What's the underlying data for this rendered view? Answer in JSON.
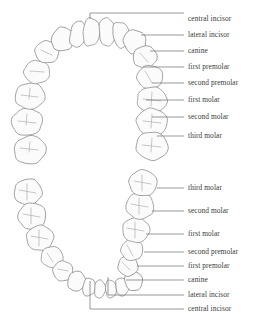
{
  "diagram": {
    "colors": {
      "tooth_outline": "#8a8a8a",
      "tooth_fill": "#fbfbfc",
      "groove": "#b0b0b0",
      "leader_line": "#6e6e6e",
      "label_text": "#3a3a3a",
      "background": "#ffffff"
    },
    "arches": [
      {
        "name": "upper-arch",
        "label": "maxillary",
        "labels": [
          {
            "id": "upper-central-incisor",
            "text": "central incisor",
            "x": 188,
            "y": 21,
            "leader": "M90,19 L90,13 L184,13"
          },
          {
            "id": "upper-lateral-incisor",
            "text": "lateral incisor",
            "x": 188,
            "y": 37,
            "leader": "M141,35 L184,35"
          },
          {
            "id": "upper-canine",
            "text": "canine",
            "x": 188,
            "y": 53,
            "leader": "M150,51 L184,51"
          },
          {
            "id": "upper-first-premolar",
            "text": "first premolar",
            "x": 188,
            "y": 69,
            "leader": "M143,67 L184,67"
          },
          {
            "id": "upper-second-premolar",
            "text": "second premolar",
            "x": 188,
            "y": 85,
            "leader": "M152,83 L184,83"
          },
          {
            "id": "upper-first-molar",
            "text": "first molar",
            "x": 188,
            "y": 102,
            "leader": "M146,100 L184,100"
          },
          {
            "id": "upper-second-molar",
            "text": "second molar",
            "x": 188,
            "y": 119,
            "leader": "M152,117 L184,117"
          },
          {
            "id": "upper-third-molar",
            "text": "third molar",
            "x": 188,
            "y": 138,
            "leader": "M157,136 L184,136"
          }
        ]
      },
      {
        "name": "lower-arch",
        "label": "mandibular",
        "labels": [
          {
            "id": "lower-third-molar",
            "text": "third molar",
            "x": 188,
            "y": 190,
            "leader": "M157,188 L184,188"
          },
          {
            "id": "lower-second-molar",
            "text": "second molar",
            "x": 188,
            "y": 213,
            "leader": "M152,211 L184,211"
          },
          {
            "id": "lower-first-molar",
            "text": "first molar",
            "x": 188,
            "y": 236,
            "leader": "M146,234 L184,234"
          },
          {
            "id": "lower-second-premolar",
            "text": "second premolar",
            "x": 188,
            "y": 254,
            "leader": "M144,252 L184,252"
          },
          {
            "id": "lower-first-premolar",
            "text": "first premolar",
            "x": 188,
            "y": 268,
            "leader": "M137,266 L184,266"
          },
          {
            "id": "lower-canine",
            "text": "canine",
            "x": 188,
            "y": 282,
            "leader": "M126,280 L184,280"
          },
          {
            "id": "lower-lateral-incisor",
            "text": "lateral incisor",
            "x": 188,
            "y": 297,
            "leader": "M108,277 L108,295 L184,295"
          },
          {
            "id": "lower-central-incisor",
            "text": "central incisor",
            "x": 188,
            "y": 311,
            "leader": "M90,281 L90,309 L184,309"
          }
        ]
      }
    ],
    "upper_teeth": [
      {
        "id": "u-l-third-molar",
        "type": "molar",
        "cx": 30,
        "cy": 150,
        "rx": 16,
        "ry": 14,
        "rot": -12,
        "grooves": "M20,148 L38,150 M30,142 L29,152"
      },
      {
        "id": "u-l-second-molar",
        "type": "molar",
        "cx": 27,
        "cy": 122,
        "rx": 15.5,
        "ry": 13.5,
        "rot": -8,
        "grooves": "M18,121 L36,123 M27,114 L26,125"
      },
      {
        "id": "u-l-first-molar",
        "type": "molar",
        "cx": 30,
        "cy": 96,
        "rx": 15,
        "ry": 13,
        "rot": -5,
        "grooves": "M21,95 L38,97 M30,88 L29,99"
      },
      {
        "id": "u-l-second-premolar",
        "type": "premolar",
        "cx": 37,
        "cy": 72,
        "rx": 13,
        "ry": 11.5,
        "rot": 0,
        "grooves": "M30,71 L44,72"
      },
      {
        "id": "u-l-first-premolar",
        "type": "premolar",
        "cx": 47,
        "cy": 52,
        "rx": 12,
        "ry": 11,
        "rot": 10,
        "grooves": "M41,50 L52,55"
      },
      {
        "id": "u-l-canine",
        "type": "canine",
        "cx": 62,
        "cy": 39,
        "rx": 12,
        "ry": 12,
        "rot": 22,
        "grooves": ""
      },
      {
        "id": "u-l-lateral-incisor",
        "type": "incisor",
        "cx": 77,
        "cy": 34,
        "rx": 10,
        "ry": 13,
        "rot": 12,
        "grooves": ""
      },
      {
        "id": "u-l-central-incisor",
        "type": "incisor",
        "cx": 90,
        "cy": 32,
        "rx": 10,
        "ry": 14,
        "rot": 4,
        "grooves": ""
      },
      {
        "id": "u-r-central-incisor",
        "type": "incisor",
        "cx": 106,
        "cy": 32,
        "rx": 10,
        "ry": 14,
        "rot": -4,
        "grooves": ""
      },
      {
        "id": "u-r-lateral-incisor",
        "type": "incisor",
        "cx": 120,
        "cy": 35,
        "rx": 10,
        "ry": 13,
        "rot": -12,
        "grooves": ""
      },
      {
        "id": "u-r-canine",
        "type": "canine",
        "cx": 134,
        "cy": 42,
        "rx": 12,
        "ry": 12,
        "rot": -22,
        "grooves": ""
      },
      {
        "id": "u-r-first-premolar",
        "type": "premolar",
        "cx": 145,
        "cy": 57,
        "rx": 12,
        "ry": 11,
        "rot": -12,
        "grooves": "M140,53 L148,62"
      },
      {
        "id": "u-r-second-premolar",
        "type": "premolar",
        "cx": 150,
        "cy": 77,
        "rx": 13,
        "ry": 11.5,
        "rot": -4,
        "grooves": "M145,71 L152,83"
      },
      {
        "id": "u-r-first-molar",
        "type": "molar",
        "cx": 152,
        "cy": 100,
        "rx": 15,
        "ry": 13,
        "rot": 4,
        "grooves": "M143,99 L161,101 M152,92 L151,106"
      },
      {
        "id": "u-r-second-molar",
        "type": "molar",
        "cx": 152,
        "cy": 122,
        "rx": 15.5,
        "ry": 13.5,
        "rot": 6,
        "grooves": "M143,121 L161,123 M152,114 L151,128"
      },
      {
        "id": "u-r-third-molar",
        "type": "molar",
        "cx": 152,
        "cy": 146,
        "rx": 16,
        "ry": 14,
        "rot": 8,
        "grooves": "M142,145 L161,147 M152,138 L151,152"
      }
    ],
    "lower_teeth": [
      {
        "id": "l-l-third-molar",
        "type": "molar",
        "cx": 28,
        "cy": 192,
        "rx": 14,
        "ry": 13,
        "rot": -15,
        "grooves": "M19,190 L36,193 M27,184 L27,200"
      },
      {
        "id": "l-l-second-molar",
        "type": "molar",
        "cx": 32,
        "cy": 216,
        "rx": 14,
        "ry": 13,
        "rot": -12,
        "grooves": "M23,214 L40,217 M31,208 L31,224"
      },
      {
        "id": "l-l-first-molar",
        "type": "molar",
        "cx": 40,
        "cy": 238,
        "rx": 13.5,
        "ry": 12.5,
        "rot": -8,
        "grooves": "M31,236 L48,239 M39,230 L39,246"
      },
      {
        "id": "l-l-second-premolar",
        "type": "premolar",
        "cx": 52,
        "cy": 257,
        "rx": 11,
        "ry": 10.5,
        "rot": 0,
        "grooves": "M47,253 L53,262"
      },
      {
        "id": "l-l-first-premolar",
        "type": "premolar",
        "cx": 63,
        "cy": 271,
        "rx": 10,
        "ry": 10,
        "rot": 8,
        "grooves": "M58,269 L68,271"
      },
      {
        "id": "l-l-canine",
        "type": "canine",
        "cx": 76,
        "cy": 281,
        "rx": 9.5,
        "ry": 10,
        "rot": 18,
        "grooves": ""
      },
      {
        "id": "l-l-lateral-incisor",
        "type": "incisor",
        "cx": 88,
        "cy": 287,
        "rx": 7.5,
        "ry": 9,
        "rot": 10,
        "grooves": ""
      },
      {
        "id": "l-l-central-incisor",
        "type": "incisor",
        "cx": 99,
        "cy": 289,
        "rx": 6.5,
        "ry": 9,
        "rot": 4,
        "grooves": ""
      },
      {
        "id": "l-r-central-incisor",
        "type": "incisor",
        "cx": 110,
        "cy": 289,
        "rx": 6.5,
        "ry": 9,
        "rot": -4,
        "grooves": ""
      },
      {
        "id": "l-r-lateral-incisor",
        "type": "incisor",
        "cx": 121,
        "cy": 287,
        "rx": 7.5,
        "ry": 9,
        "rot": -10,
        "grooves": ""
      },
      {
        "id": "l-r-canine",
        "type": "canine",
        "cx": 133,
        "cy": 281,
        "rx": 9.5,
        "ry": 10,
        "rot": -18,
        "grooves": ""
      },
      {
        "id": "l-r-first-premolar",
        "type": "premolar",
        "cx": 128,
        "cy": 266,
        "rx": 10,
        "ry": 10,
        "rot": -12,
        "grooves": "M122,262 L130,270"
      },
      {
        "id": "l-r-second-premolar",
        "type": "premolar",
        "cx": 132,
        "cy": 250,
        "rx": 11,
        "ry": 10.5,
        "rot": -6,
        "grooves": "M127,245 L133,256"
      },
      {
        "id": "l-r-first-molar",
        "type": "molar",
        "cx": 136,
        "cy": 230,
        "rx": 13.5,
        "ry": 12.5,
        "rot": 2,
        "grooves": "M127,228 L144,231 M135,222 L135,238"
      },
      {
        "id": "l-r-second-molar",
        "type": "molar",
        "cx": 140,
        "cy": 206,
        "rx": 14,
        "ry": 13,
        "rot": 5,
        "grooves": "M131,204 L148,207 M139,198 L139,214"
      },
      {
        "id": "l-r-third-molar",
        "type": "molar",
        "cx": 143,
        "cy": 183,
        "rx": 14,
        "ry": 13,
        "rot": 8,
        "grooves": "M134,181 L151,184 M142,175 L142,191"
      }
    ]
  }
}
